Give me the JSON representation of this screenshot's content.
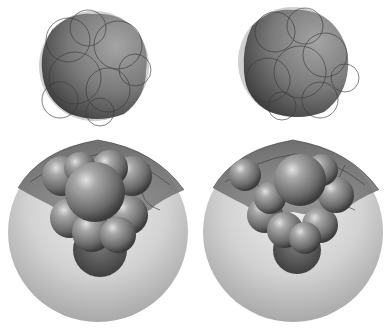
{
  "figure": {
    "panels": [
      {
        "id": "top-left",
        "label": "",
        "description": "dark sphere cluster with overlapping circle outlines"
      },
      {
        "id": "top-right",
        "label": "",
        "description": "dark sphere cluster with overlapping circle outlines"
      },
      {
        "id": "bottom-left",
        "label": "",
        "description": "space-filling molecule inside large translucent sphere"
      },
      {
        "id": "bottom-right",
        "label": "",
        "description": "space-filling molecule inside large translucent sphere"
      }
    ],
    "colors": {
      "background": "#ffffff",
      "outer_sphere_light": "#e6e6e6",
      "outer_sphere_dark": "#a8a8a8",
      "inner_body": "#6a6a6a",
      "atom_highlight": "#d8d8d8",
      "outline": "#3a3a3a"
    }
  }
}
